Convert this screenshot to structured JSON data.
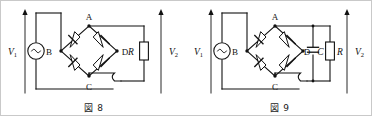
{
  "document": {
    "kind": "electronics-figure-pair",
    "description": "Two full-wave bridge rectifier circuit diagrams"
  },
  "figures": [
    {
      "id": "figure-8",
      "caption": "図 8",
      "source_label": "V",
      "source_label_sub": "1",
      "source_icon": "ac-source-icon",
      "output_label": "V",
      "output_label_sub": "2",
      "bridge_nodes": {
        "top": "A",
        "left": "B",
        "bottom": "C",
        "right": "D"
      },
      "diode_count": 4,
      "components": [
        {
          "name": "resistor",
          "label": "R",
          "italic": true
        },
        {
          "name": "ac-source",
          "label": "V1"
        }
      ],
      "wire_hop": true
    },
    {
      "id": "figure-9",
      "caption": "図 9",
      "source_label": "V",
      "source_label_sub": "1",
      "source_icon": "ac-source-icon",
      "output_label": "V",
      "output_label_sub": "2",
      "bridge_nodes": {
        "top": "A",
        "left": "B",
        "bottom": "C",
        "right": "D"
      },
      "diode_count": 4,
      "components": [
        {
          "name": "capacitor",
          "label": "C",
          "italic": true
        },
        {
          "name": "resistor",
          "label": "R",
          "italic": true
        },
        {
          "name": "ac-source",
          "label": "V1"
        }
      ],
      "wire_hop": true
    }
  ],
  "colors": {
    "ink": "#111111",
    "paper": "#ffffff",
    "border": "#c9c9c9"
  }
}
